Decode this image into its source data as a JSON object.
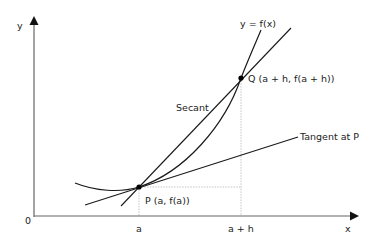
{
  "diagram": {
    "axes": {
      "y_label": "y",
      "x_label": "x",
      "origin_label": "0"
    },
    "curve_label": "y = f(x)",
    "secant_label": "Secant",
    "tangent_label": "Tangent at P",
    "point_p_label": "P (a, f(a))",
    "point_q_label": "Q (a + h, f(a + h))",
    "tick_a_label": "a",
    "tick_a_plus_h_label": "a + h",
    "colors": {
      "line": "#1a1a1a",
      "axis": "#555555",
      "guide": "#aaaaaa",
      "background": "#ffffff"
    }
  }
}
